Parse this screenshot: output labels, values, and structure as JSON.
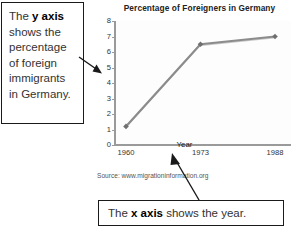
{
  "chart_data": {
    "type": "line",
    "title": "Percentage of Foreigners in Germany",
    "xlabel": "Year",
    "ylabel": "",
    "categories": [
      "1960",
      "1973",
      "1988"
    ],
    "x": [
      1960,
      1973,
      1988
    ],
    "values": [
      1.2,
      6.5,
      7.0
    ],
    "series": [
      {
        "name": "Percentage of foreigners",
        "values": [
          1.2,
          6.5,
          7.0
        ]
      }
    ],
    "ylim": [
      0,
      8
    ],
    "yticks": [
      "8",
      "7",
      "6",
      "5",
      "4",
      "3",
      "2",
      "1",
      "0"
    ],
    "ytick_values": [
      8,
      7,
      6,
      5,
      4,
      3,
      2,
      1,
      0
    ],
    "grid": false,
    "legend": "none",
    "marker": "diamond",
    "line_color": "#8c8c8c",
    "source": "Source: www.migrationinformation.org"
  },
  "annotations": {
    "y_axis_note": {
      "lines": [
        "The ",
        "y axis",
        " shows the percentage of foreign immigrants in Germany."
      ],
      "prefix": "The ",
      "bold": "y axis",
      "suffix": " shows the percentage of foreign immigrants in Germany."
    },
    "x_axis_note": {
      "prefix": "The ",
      "bold": "x axis",
      "suffix": " shows the year."
    }
  },
  "colors": {
    "line": "#8c8c8c",
    "marker": "#6f6f6f",
    "axis": "#9a9a9a",
    "text": "#333333",
    "box_border": "#1a1a1a",
    "background": "#ffffff"
  }
}
